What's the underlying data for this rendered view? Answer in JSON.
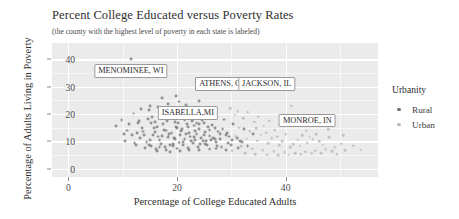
{
  "chart_data": {
    "type": "scatter",
    "title": "Percent College Educated versus Poverty Rates",
    "subtitle": "(the county with the highest level of poverty in each state is labeled)",
    "xlabel": "Percentage of College Educated Adults",
    "ylabel": "Percentage of Adults Living in Poverty",
    "xlim": [
      -3,
      57
    ],
    "ylim": [
      -3,
      46
    ],
    "xticks": [
      0,
      20,
      40
    ],
    "xtick_labels": [
      "0",
      "20",
      "40"
    ],
    "yticks": [
      0,
      10,
      20,
      30,
      40
    ],
    "ytick_labels": [
      "0",
      "10",
      "20",
      "30",
      "40"
    ],
    "grid": true,
    "legend": {
      "title": "Urbanity",
      "position": "right",
      "entries": [
        {
          "label": "Rural",
          "color": "#6f6f6f"
        },
        {
          "label": "Urban",
          "color": "#b9b9b9"
        }
      ]
    },
    "annotations": [
      {
        "text": "MENOMINEE, WI",
        "x": 11.5,
        "y": 40.0,
        "label_x": 11.5,
        "label_y": 38.2
      },
      {
        "text": "ATHENS, OH",
        "x": 28.5,
        "y": 31.0,
        "label_x": 28.5,
        "label_y": 33.6
      },
      {
        "text": "JACKSON, IL",
        "x": 36.5,
        "y": 31.2,
        "label_x": 36.5,
        "label_y": 33.6
      },
      {
        "text": "ISABELLA,MI",
        "x": 24.0,
        "y": 24.8,
        "label_x": 22.0,
        "label_y": 23.0
      },
      {
        "text": "MONROE, IN",
        "x": 41.0,
        "y": 23.0,
        "label_x": 44.0,
        "label_y": 20.2
      }
    ],
    "series": [
      {
        "name": "Rural",
        "color": "#6f6f6f",
        "points": [
          [
            11.5,
            40.0
          ],
          [
            17.2,
            25.8
          ],
          [
            19.8,
            26.6
          ],
          [
            14.8,
            21.6
          ],
          [
            20.8,
            21.2
          ],
          [
            19.4,
            19.2
          ],
          [
            21.6,
            23.4
          ],
          [
            22.4,
            20.4
          ],
          [
            18.2,
            17.6
          ],
          [
            16.4,
            15.4
          ],
          [
            20.2,
            16.8
          ],
          [
            22.8,
            17.4
          ],
          [
            17.6,
            14.2
          ],
          [
            19.0,
            13.0
          ],
          [
            21.0,
            14.4
          ],
          [
            23.2,
            15.8
          ],
          [
            15.6,
            12.4
          ],
          [
            18.4,
            11.6
          ],
          [
            20.6,
            12.2
          ],
          [
            22.2,
            13.2
          ],
          [
            24.0,
            14.6
          ],
          [
            16.8,
            10.4
          ],
          [
            19.6,
            10.8
          ],
          [
            21.4,
            11.0
          ],
          [
            23.6,
            12.6
          ],
          [
            25.2,
            13.4
          ],
          [
            17.0,
            9.2
          ],
          [
            18.8,
            8.8
          ],
          [
            20.4,
            9.6
          ],
          [
            22.6,
            10.2
          ],
          [
            24.4,
            11.4
          ],
          [
            26.0,
            12.0
          ],
          [
            15.2,
            8.4
          ],
          [
            17.8,
            7.8
          ],
          [
            19.2,
            8.2
          ],
          [
            21.2,
            8.6
          ],
          [
            23.0,
            9.4
          ],
          [
            24.8,
            10.0
          ],
          [
            26.6,
            11.2
          ],
          [
            16.2,
            7.2
          ],
          [
            18.0,
            6.8
          ],
          [
            20.0,
            7.4
          ],
          [
            22.0,
            7.6
          ],
          [
            23.8,
            8.0
          ],
          [
            25.6,
            8.8
          ],
          [
            27.2,
            9.8
          ],
          [
            14.4,
            9.8
          ],
          [
            16.6,
            11.8
          ],
          [
            18.6,
            12.8
          ],
          [
            20.8,
            13.8
          ],
          [
            22.4,
            11.8
          ],
          [
            24.2,
            9.0
          ],
          [
            26.2,
            10.4
          ],
          [
            28.0,
            11.0
          ],
          [
            13.8,
            13.6
          ],
          [
            15.8,
            14.8
          ],
          [
            17.4,
            16.4
          ],
          [
            19.8,
            15.2
          ],
          [
            21.8,
            16.2
          ],
          [
            23.4,
            13.8
          ],
          [
            25.0,
            12.2
          ],
          [
            27.0,
            10.8
          ],
          [
            29.0,
            12.4
          ],
          [
            12.8,
            16.8
          ],
          [
            14.6,
            18.2
          ],
          [
            16.0,
            17.2
          ],
          [
            18.2,
            19.8
          ],
          [
            20.2,
            18.6
          ],
          [
            22.8,
            19.6
          ],
          [
            24.6,
            17.8
          ],
          [
            26.4,
            16.0
          ],
          [
            28.4,
            14.4
          ],
          [
            13.2,
            11.2
          ],
          [
            15.0,
            10.6
          ],
          [
            17.2,
            12.0
          ],
          [
            19.4,
            11.4
          ],
          [
            21.6,
            12.8
          ],
          [
            23.2,
            11.6
          ],
          [
            25.4,
            10.2
          ],
          [
            27.4,
            8.4
          ],
          [
            29.4,
            9.4
          ],
          [
            12.4,
            8.8
          ],
          [
            14.2,
            7.6
          ],
          [
            16.4,
            6.6
          ],
          [
            18.8,
            6.2
          ],
          [
            20.6,
            6.4
          ],
          [
            22.2,
            6.8
          ],
          [
            24.0,
            7.0
          ],
          [
            26.0,
            7.2
          ],
          [
            28.2,
            7.8
          ],
          [
            30.0,
            8.6
          ],
          [
            11.8,
            12.4
          ],
          [
            13.6,
            15.0
          ],
          [
            15.4,
            19.0
          ],
          [
            17.0,
            20.8
          ],
          [
            19.0,
            22.4
          ],
          [
            21.0,
            20.0
          ],
          [
            23.0,
            18.2
          ],
          [
            25.0,
            16.6
          ],
          [
            27.0,
            14.8
          ],
          [
            29.2,
            13.2
          ],
          [
            31.0,
            11.4
          ],
          [
            10.8,
            14.0
          ],
          [
            12.6,
            13.0
          ],
          [
            14.0,
            12.2
          ],
          [
            16.0,
            13.4
          ],
          [
            18.0,
            14.0
          ],
          [
            20.0,
            14.8
          ],
          [
            22.0,
            15.4
          ],
          [
            24.0,
            16.2
          ],
          [
            26.0,
            14.2
          ],
          [
            28.0,
            12.6
          ],
          [
            30.2,
            10.6
          ],
          [
            32.0,
            9.8
          ],
          [
            9.8,
            17.8
          ],
          [
            11.2,
            16.2
          ],
          [
            13.0,
            17.4
          ],
          [
            15.2,
            16.6
          ],
          [
            17.6,
            18.4
          ],
          [
            19.6,
            17.0
          ],
          [
            21.4,
            17.8
          ],
          [
            23.6,
            16.8
          ],
          [
            25.8,
            15.2
          ],
          [
            27.6,
            13.6
          ],
          [
            29.6,
            11.8
          ],
          [
            31.6,
            10.2
          ],
          [
            10.4,
            10.0
          ],
          [
            12.2,
            9.4
          ],
          [
            14.8,
            8.6
          ],
          [
            16.8,
            8.0
          ],
          [
            19.2,
            9.0
          ],
          [
            21.2,
            9.8
          ],
          [
            23.4,
            10.6
          ],
          [
            25.2,
            9.2
          ],
          [
            27.2,
            7.4
          ],
          [
            29.0,
            6.8
          ],
          [
            31.2,
            7.6
          ],
          [
            33.0,
            8.2
          ],
          [
            18.4,
            23.8
          ],
          [
            20.4,
            24.6
          ],
          [
            16.6,
            22.6
          ],
          [
            22.6,
            22.0
          ],
          [
            24.4,
            21.4
          ],
          [
            26.6,
            19.4
          ],
          [
            28.6,
            18.0
          ],
          [
            30.4,
            16.4
          ],
          [
            32.4,
            14.6
          ],
          [
            34.0,
            12.8
          ],
          [
            28.5,
            31.0
          ],
          [
            36.5,
            31.2
          ],
          [
            24.0,
            24.8
          ],
          [
            12.0,
            20.2
          ],
          [
            13.4,
            21.8
          ],
          [
            15.0,
            23.0
          ],
          [
            10.2,
            12.8
          ],
          [
            8.8,
            15.6
          ]
        ]
      },
      {
        "name": "Urban",
        "color": "#b9b9b9",
        "points": [
          [
            30.6,
            19.8
          ],
          [
            32.2,
            18.6
          ],
          [
            34.2,
            17.2
          ],
          [
            36.0,
            15.8
          ],
          [
            38.0,
            14.2
          ],
          [
            40.0,
            12.6
          ],
          [
            31.4,
            15.0
          ],
          [
            33.4,
            13.8
          ],
          [
            35.4,
            12.4
          ],
          [
            37.4,
            11.2
          ],
          [
            39.4,
            10.0
          ],
          [
            41.4,
            9.0
          ],
          [
            30.8,
            12.0
          ],
          [
            32.8,
            11.0
          ],
          [
            34.8,
            10.2
          ],
          [
            36.8,
            9.4
          ],
          [
            38.8,
            8.6
          ],
          [
            40.8,
            7.8
          ],
          [
            42.6,
            8.4
          ],
          [
            44.0,
            9.6
          ],
          [
            41.0,
            23.0
          ],
          [
            43.0,
            12.2
          ],
          [
            45.0,
            10.8
          ],
          [
            46.8,
            8.8
          ],
          [
            33.0,
            20.6
          ],
          [
            35.0,
            19.0
          ],
          [
            37.0,
            17.6
          ],
          [
            39.0,
            16.2
          ],
          [
            43.8,
            14.0
          ],
          [
            45.6,
            12.6
          ],
          [
            31.8,
            8.2
          ],
          [
            33.8,
            7.4
          ],
          [
            35.8,
            6.8
          ],
          [
            37.8,
            6.4
          ],
          [
            39.8,
            6.0
          ],
          [
            41.8,
            5.8
          ],
          [
            43.6,
            6.2
          ],
          [
            45.4,
            6.6
          ],
          [
            47.4,
            7.2
          ],
          [
            49.0,
            8.0
          ],
          [
            48.0,
            11.6
          ],
          [
            50.2,
            9.2
          ],
          [
            29.8,
            22.2
          ],
          [
            31.2,
            21.0
          ],
          [
            34.6,
            14.8
          ],
          [
            36.4,
            13.2
          ],
          [
            38.4,
            11.8
          ],
          [
            42.2,
            10.6
          ],
          [
            44.4,
            11.8
          ],
          [
            46.2,
            10.0
          ],
          [
            48.6,
            6.4
          ],
          [
            51.0,
            6.8
          ],
          [
            52.4,
            8.4
          ],
          [
            53.8,
            7.0
          ],
          [
            30.2,
            6.6
          ],
          [
            32.6,
            5.6
          ],
          [
            34.4,
            5.4
          ],
          [
            36.6,
            5.2
          ],
          [
            38.6,
            5.0
          ],
          [
            40.6,
            5.2
          ],
          [
            42.8,
            5.4
          ],
          [
            44.8,
            5.6
          ],
          [
            46.6,
            5.8
          ],
          [
            49.4,
            5.4
          ],
          [
            47.8,
            14.4
          ],
          [
            50.6,
            12.2
          ]
        ]
      }
    ]
  }
}
